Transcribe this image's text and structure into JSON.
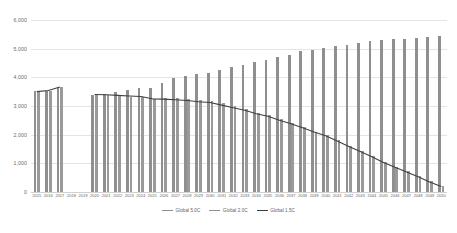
{
  "chart_data": {
    "type": "bar",
    "title": "",
    "xlabel": "",
    "ylabel": "",
    "ylim": [
      0,
      6000
    ],
    "ytick_step": 1000,
    "yticks": [
      "0",
      "1,000",
      "2,000",
      "3,000",
      "4,000",
      "5,000",
      "6,000"
    ],
    "grid": true,
    "legend_position": "bottom-center",
    "categories": [
      "2015",
      "2016",
      "2017",
      "2018",
      "2019",
      "2020",
      "2021",
      "2022",
      "2023",
      "2024",
      "2025",
      "2026",
      "2027",
      "2028",
      "2029",
      "2030",
      "2031",
      "2032",
      "2033",
      "2034",
      "2035",
      "2036",
      "2037",
      "2038",
      "2039",
      "2040",
      "2041",
      "2042",
      "2043",
      "2044",
      "2045",
      "2046",
      "2047",
      "2048",
      "2049",
      "2050"
    ],
    "series": [
      {
        "name": "Global 5.0C",
        "render": "bar",
        "color": "#8f8f8f",
        "values": [
          3510,
          3530,
          3670,
          null,
          null,
          3400,
          3430,
          3500,
          3560,
          3620,
          3640,
          3800,
          3960,
          4030,
          4100,
          4150,
          4270,
          4350,
          4420,
          4540,
          4620,
          4720,
          4790,
          4910,
          4960,
          5030,
          5080,
          5120,
          5200,
          5270,
          5300,
          5330,
          5350,
          5360,
          5410,
          5450
        ]
      },
      {
        "name": "Global 2.0C",
        "render": "bar",
        "color": "#9a9a9a",
        "values": [
          3500,
          3520,
          3650,
          null,
          null,
          3390,
          3380,
          3340,
          3320,
          3300,
          3240,
          3290,
          3270,
          3240,
          3200,
          3180,
          3090,
          2990,
          2900,
          2770,
          2670,
          2530,
          2410,
          2260,
          2110,
          1990,
          1800,
          1610,
          1430,
          1250,
          1050,
          880,
          720,
          550,
          370,
          200
        ]
      },
      {
        "name": "Global 1.5C",
        "render": "line",
        "color": "#3f3f3f",
        "values": [
          3500,
          3540,
          3660,
          null,
          null,
          3400,
          3390,
          3370,
          3350,
          3330,
          3250,
          3240,
          3220,
          3190,
          3150,
          3120,
          3030,
          2940,
          2850,
          2730,
          2640,
          2500,
          2380,
          2240,
          2090,
          1960,
          1780,
          1590,
          1410,
          1230,
          1030,
          860,
          700,
          530,
          350,
          190
        ]
      }
    ]
  },
  "legend": {
    "items": [
      {
        "label": "Global 5.0C",
        "style": "bar"
      },
      {
        "label": "Global 2.0C",
        "style": "bar"
      },
      {
        "label": "Global 1.5C",
        "style": "line"
      }
    ]
  }
}
